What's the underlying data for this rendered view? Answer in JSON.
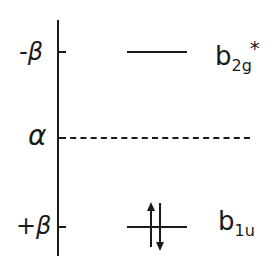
{
  "diagram": {
    "type": "molecular-orbital-energy-level-diagram",
    "axis": {
      "labels": [
        {
          "text": "-β",
          "position": "top"
        },
        {
          "text": "α",
          "position": "middle"
        },
        {
          "text": "+β",
          "position": "bottom"
        }
      ]
    },
    "levels": [
      {
        "name": "b",
        "subscript": "2g",
        "superscript": "*",
        "energy": "-β",
        "electrons": 0,
        "line_style": "solid"
      },
      {
        "name": "b",
        "subscript": "1u",
        "superscript": "",
        "energy": "+β",
        "electrons": 2,
        "line_style": "solid",
        "spins": [
          "up",
          "down"
        ]
      }
    ],
    "reference_line": {
      "energy": "α",
      "line_style": "dashed"
    }
  }
}
